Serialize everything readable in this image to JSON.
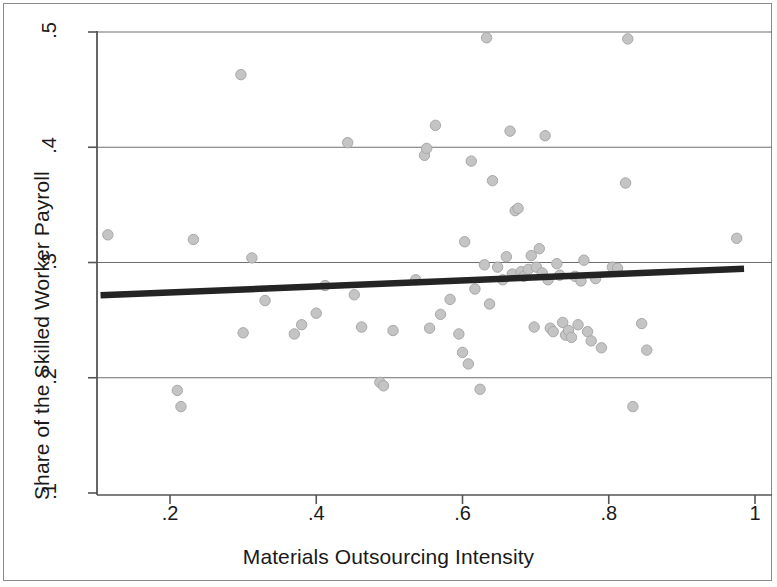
{
  "chart_data": {
    "type": "scatter",
    "title": "",
    "xlabel": "Materials Outsourcing Intensity",
    "ylabel": "Share of the Skilled Worker Payroll",
    "xlim": [
      0.105,
      1.02
    ],
    "ylim": [
      0.1,
      0.5
    ],
    "xticks": [
      0.2,
      0.4,
      0.6,
      0.8,
      1.0
    ],
    "xtick_labels": [
      ".2",
      ".4",
      ".6",
      ".8",
      "1"
    ],
    "yticks": [
      0.1,
      0.2,
      0.3,
      0.4,
      0.5
    ],
    "ytick_labels": [
      ".1",
      ".2",
      ".3",
      ".4",
      ".5"
    ],
    "grid": "horizontal",
    "legend": "none",
    "marker_color": "#c4c4c4",
    "marker_edge_color": "#a8a8a8",
    "fit_line_color": "#242424",
    "axis_color": "#555555",
    "grid_color": "#6e6e6e",
    "points": [
      [
        0.115,
        0.324
      ],
      [
        0.21,
        0.189
      ],
      [
        0.215,
        0.175
      ],
      [
        0.232,
        0.32
      ],
      [
        0.297,
        0.463
      ],
      [
        0.3,
        0.239
      ],
      [
        0.312,
        0.304
      ],
      [
        0.33,
        0.267
      ],
      [
        0.37,
        0.238
      ],
      [
        0.38,
        0.246
      ],
      [
        0.4,
        0.256
      ],
      [
        0.412,
        0.28
      ],
      [
        0.443,
        0.404
      ],
      [
        0.452,
        0.272
      ],
      [
        0.462,
        0.244
      ],
      [
        0.487,
        0.196
      ],
      [
        0.492,
        0.193
      ],
      [
        0.505,
        0.241
      ],
      [
        0.536,
        0.285
      ],
      [
        0.548,
        0.393
      ],
      [
        0.551,
        0.399
      ],
      [
        0.555,
        0.243
      ],
      [
        0.563,
        0.419
      ],
      [
        0.57,
        0.255
      ],
      [
        0.583,
        0.268
      ],
      [
        0.595,
        0.238
      ],
      [
        0.6,
        0.222
      ],
      [
        0.603,
        0.318
      ],
      [
        0.608,
        0.212
      ],
      [
        0.612,
        0.388
      ],
      [
        0.617,
        0.277
      ],
      [
        0.624,
        0.19
      ],
      [
        0.63,
        0.298
      ],
      [
        0.633,
        0.495
      ],
      [
        0.637,
        0.264
      ],
      [
        0.641,
        0.371
      ],
      [
        0.648,
        0.296
      ],
      [
        0.655,
        0.285
      ],
      [
        0.66,
        0.305
      ],
      [
        0.665,
        0.414
      ],
      [
        0.668,
        0.29
      ],
      [
        0.672,
        0.345
      ],
      [
        0.676,
        0.347
      ],
      [
        0.68,
        0.292
      ],
      [
        0.684,
        0.288
      ],
      [
        0.69,
        0.294
      ],
      [
        0.694,
        0.306
      ],
      [
        0.698,
        0.244
      ],
      [
        0.701,
        0.296
      ],
      [
        0.705,
        0.312
      ],
      [
        0.709,
        0.291
      ],
      [
        0.713,
        0.41
      ],
      [
        0.717,
        0.285
      ],
      [
        0.72,
        0.243
      ],
      [
        0.724,
        0.24
      ],
      [
        0.729,
        0.299
      ],
      [
        0.733,
        0.289
      ],
      [
        0.737,
        0.248
      ],
      [
        0.741,
        0.237
      ],
      [
        0.745,
        0.241
      ],
      [
        0.749,
        0.235
      ],
      [
        0.754,
        0.288
      ],
      [
        0.758,
        0.246
      ],
      [
        0.762,
        0.284
      ],
      [
        0.766,
        0.302
      ],
      [
        0.771,
        0.24
      ],
      [
        0.776,
        0.232
      ],
      [
        0.782,
        0.286
      ],
      [
        0.79,
        0.226
      ],
      [
        0.805,
        0.296
      ],
      [
        0.812,
        0.295
      ],
      [
        0.823,
        0.369
      ],
      [
        0.826,
        0.494
      ],
      [
        0.833,
        0.175
      ],
      [
        0.845,
        0.247
      ],
      [
        0.852,
        0.224
      ],
      [
        0.975,
        0.321
      ]
    ],
    "fit_line": {
      "x0": 0.105,
      "y0": 0.2715,
      "x1": 0.985,
      "y1": 0.2945
    }
  }
}
